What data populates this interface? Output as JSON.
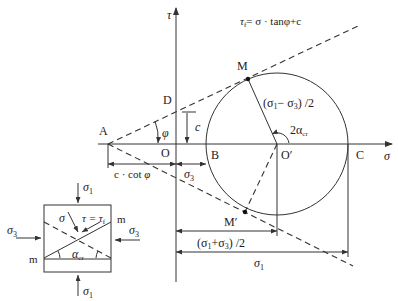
{
  "title_formula": "τ_f = σ · tanφ + c",
  "formula": {
    "tau": "τ",
    "sub_f": "f",
    "rest": "= σ · tanφ+c"
  },
  "axes": {
    "tau_label": "τ",
    "sigma_label": "σ"
  },
  "points": {
    "A": "A",
    "O": "O",
    "D": "D",
    "B": "B",
    "O_prime": "O′",
    "C": "C",
    "M": "M",
    "M_prime": "M′"
  },
  "labels": {
    "phi": "φ",
    "c": "c",
    "radius": "(σ1− σ3) /2",
    "radius_parts": {
      "open": "(σ",
      "s1": "1",
      "minus": "− σ",
      "s3": "3",
      "close": ") /2"
    },
    "angle": {
      "main": "2α",
      "sub": "cr"
    },
    "c_cot_phi": {
      "text": "c · cot ",
      "phi": "φ"
    },
    "sigma3_dim": {
      "main": "σ",
      "sub": "3"
    },
    "center_dim": {
      "open": "(σ",
      "s1": "1",
      "plus": "+σ",
      "s3": "3",
      "close": ") /2"
    },
    "sigma1_dim": {
      "main": "σ",
      "sub": "1"
    }
  },
  "element": {
    "sigma1_top": {
      "main": "σ",
      "sub": "1"
    },
    "sigma1_bottom": {
      "main": "σ",
      "sub": "1"
    },
    "sigma3_left": {
      "main": "σ",
      "sub": "3"
    },
    "sigma3_right": {
      "main": "σ",
      "sub": "3"
    },
    "sigma": "σ",
    "tau_eq": {
      "main": "τ = τ",
      "sub": "f"
    },
    "m_left": "m",
    "m_right": "m",
    "alpha": {
      "main": "α",
      "sub": "cr"
    }
  },
  "geometry": {
    "circle_center": [
      277,
      144
    ],
    "circle_radius": 71,
    "sigma_axis_y": 144,
    "tau_axis_x": 176
  }
}
